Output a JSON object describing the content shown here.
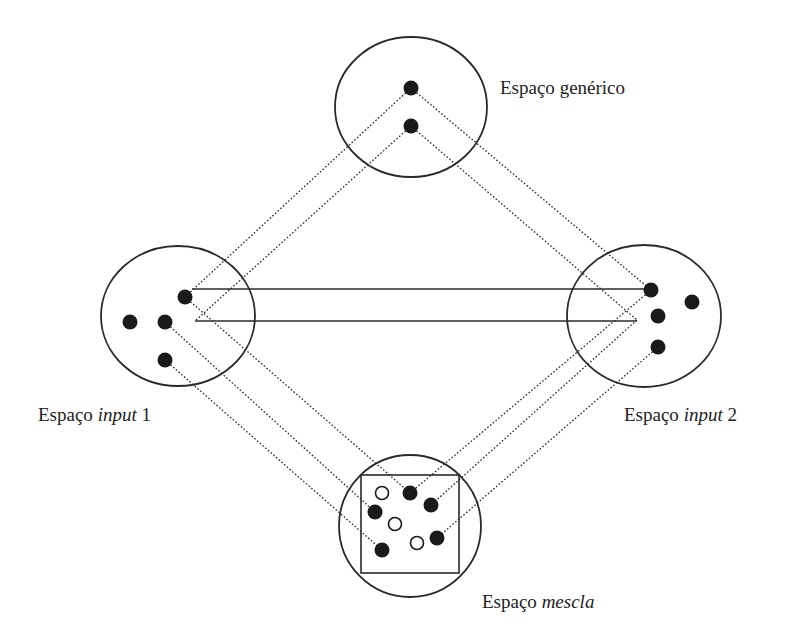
{
  "colors": {
    "stroke": "#2a2a2a",
    "dot": "#1a1a1a",
    "background": "#ffffff"
  },
  "spaces": {
    "generic": {
      "label_prefix": "Espaço",
      "label_term": "genérico",
      "label_suffix": ""
    },
    "input1": {
      "label_prefix": "Espaço",
      "label_term": "input",
      "label_suffix": "1"
    },
    "input2": {
      "label_prefix": "Espaço",
      "label_term": "input",
      "label_suffix": "2"
    },
    "blend": {
      "label_prefix": "Espaço",
      "label_term": "mescla",
      "label_suffix": ""
    }
  },
  "diagram": {
    "circles": [
      {
        "id": "generic",
        "cx": 411,
        "cy": 107,
        "rx": 76,
        "ry": 70
      },
      {
        "id": "input1",
        "cx": 178,
        "cy": 316,
        "rx": 77,
        "ry": 70
      },
      {
        "id": "input2",
        "cx": 644,
        "cy": 316,
        "rx": 77,
        "ry": 71
      },
      {
        "id": "blend",
        "cx": 410,
        "cy": 526,
        "rx": 71,
        "ry": 71
      }
    ],
    "blend_frame": {
      "x": 361,
      "y": 475,
      "w": 98,
      "h": 98
    },
    "dots": [
      {
        "space": "generic",
        "x": 411,
        "y": 88,
        "filled": true
      },
      {
        "space": "generic",
        "x": 411,
        "y": 126,
        "filled": true
      },
      {
        "space": "input1",
        "x": 185,
        "y": 297,
        "filled": true
      },
      {
        "space": "input1",
        "x": 130,
        "y": 322,
        "filled": true
      },
      {
        "space": "input1",
        "x": 165,
        "y": 322,
        "filled": true
      },
      {
        "space": "input1",
        "x": 165,
        "y": 360,
        "filled": true
      },
      {
        "space": "input2",
        "x": 651,
        "y": 290,
        "filled": true
      },
      {
        "space": "input2",
        "x": 692,
        "y": 302,
        "filled": true
      },
      {
        "space": "input2",
        "x": 658,
        "y": 316,
        "filled": true
      },
      {
        "space": "input2",
        "x": 658,
        "y": 347,
        "filled": true
      },
      {
        "space": "blend",
        "x": 382,
        "y": 493,
        "filled": false
      },
      {
        "space": "blend",
        "x": 410,
        "y": 493,
        "filled": true
      },
      {
        "space": "blend",
        "x": 431,
        "y": 505,
        "filled": true
      },
      {
        "space": "blend",
        "x": 375,
        "y": 512,
        "filled": true
      },
      {
        "space": "blend",
        "x": 395,
        "y": 524,
        "filled": false
      },
      {
        "space": "blend",
        "x": 437,
        "y": 538,
        "filled": true
      },
      {
        "space": "blend",
        "x": 417,
        "y": 543,
        "filled": false
      },
      {
        "space": "blend",
        "x": 382,
        "y": 550,
        "filled": true
      }
    ],
    "solid_links": [
      {
        "x1": 192,
        "y1": 289,
        "x2": 645,
        "y2": 289
      },
      {
        "x1": 195,
        "y1": 321,
        "x2": 637,
        "y2": 321
      }
    ],
    "dotted_links": [
      {
        "x1": 411,
        "y1": 88,
        "x2": 185,
        "y2": 297
      },
      {
        "x1": 411,
        "y1": 126,
        "x2": 195,
        "y2": 321
      },
      {
        "x1": 411,
        "y1": 88,
        "x2": 651,
        "y2": 290
      },
      {
        "x1": 411,
        "y1": 126,
        "x2": 637,
        "y2": 320
      },
      {
        "x1": 185,
        "y1": 297,
        "x2": 410,
        "y2": 493
      },
      {
        "x1": 165,
        "y1": 322,
        "x2": 375,
        "y2": 512
      },
      {
        "x1": 165,
        "y1": 360,
        "x2": 382,
        "y2": 550
      },
      {
        "x1": 651,
        "y1": 290,
        "x2": 410,
        "y2": 493
      },
      {
        "x1": 637,
        "y1": 320,
        "x2": 431,
        "y2": 505
      },
      {
        "x1": 658,
        "y1": 347,
        "x2": 437,
        "y2": 538
      }
    ]
  }
}
